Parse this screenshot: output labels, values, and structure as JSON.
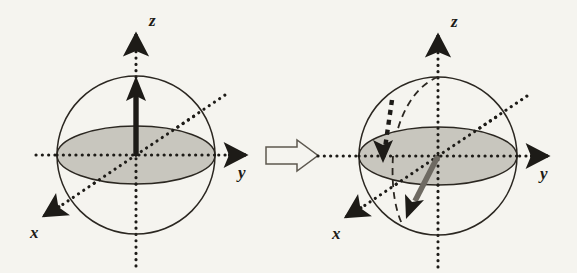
{
  "figure": {
    "background_color": "#f5f4ef",
    "ink_color": "#1d1b17",
    "equator_fill_color": "#c8c6be",
    "vector_gray_color": "#6e6a62",
    "panels": [
      {
        "id": "initial-state",
        "role": "before",
        "center": {
          "x": 136,
          "y": 155
        },
        "radius": 79,
        "axes": [
          {
            "name": "z",
            "label": "z",
            "label_x": 149,
            "label_y": 26,
            "style": "dotted"
          },
          {
            "name": "y",
            "label": "y",
            "label_x": 238,
            "label_y": 178,
            "style": "dotted"
          },
          {
            "name": "x",
            "label": "x",
            "label_x": 34,
            "label_y": 238,
            "style": "dotted"
          }
        ],
        "vectors": [
          {
            "name": "magnetization-vector",
            "label": "",
            "style": "solid-black-thick",
            "from": {
              "x": 136,
              "y": 155
            },
            "to": {
              "x": 136,
              "y": 80
            },
            "description": "magnetization aligned along +z"
          }
        ]
      },
      {
        "id": "precessing-state",
        "role": "after",
        "center": {
          "x": 438,
          "y": 156
        },
        "radius": 79,
        "axes": [
          {
            "name": "z",
            "label": "z",
            "label_x": 451,
            "label_y": 27,
            "style": "dotted"
          },
          {
            "name": "y",
            "label": "y",
            "label_x": 540,
            "label_y": 179,
            "style": "dotted"
          },
          {
            "name": "x",
            "label": "x",
            "label_x": 336,
            "label_y": 239,
            "style": "dotted"
          }
        ],
        "vectors": [
          {
            "name": "magnetization-vector",
            "label": "",
            "style": "solid-gray-thick",
            "from": {
              "x": 438,
              "y": 156
            },
            "to": {
              "x": 410,
              "y": 213
            },
            "description": "magnetization tipped below the equatorial plane"
          },
          {
            "name": "tipping-indicator-arrow",
            "label": "",
            "style": "dotted-black-thick",
            "from": {
              "x": 392,
              "y": 100
            },
            "to": {
              "x": 384,
              "y": 160
            },
            "description": "dotted arrow indicating downward tipping"
          },
          {
            "name": "precession-trajectory",
            "label": "",
            "style": "dashed-arc",
            "from": {
              "x": 438,
              "y": 77
            },
            "to": {
              "x": 403,
              "y": 225
            },
            "description": "dashed arc tracing the vector path from the pole"
          }
        ]
      }
    ],
    "transition": {
      "name": "transition-arrow",
      "label": "",
      "style": "hollow-outline",
      "direction": "right",
      "x": 266,
      "y": 140,
      "width": 52,
      "height": 31
    }
  }
}
